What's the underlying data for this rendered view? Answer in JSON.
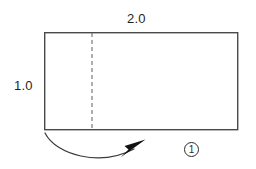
{
  "figure": {
    "type": "geometry-diagram",
    "canvas": {
      "width": 256,
      "height": 169,
      "background": "#ffffff"
    },
    "rectangle": {
      "name": "main-rectangle",
      "x": 44,
      "y": 32,
      "width": 194,
      "height": 98,
      "stroke": "#4a4a4a",
      "stroke_width": 1.4,
      "fill": "none"
    },
    "dashed_line": {
      "name": "fold-dashed-line",
      "x": 92,
      "y_top": 32,
      "y_bottom": 130,
      "stroke": "#6e6e6e",
      "stroke_width": 1.1,
      "dash_pattern": "4 3"
    },
    "arrow": {
      "name": "rotation-arrow",
      "path": "M45,133 C58,158 104,168 137,147",
      "stroke": "#3a3a3a",
      "stroke_width": 1.2,
      "head_points": "145,140 121,157 128,150 124,147",
      "head_fill": "#111111"
    },
    "labels": {
      "width": "2.0",
      "height": "1.0"
    },
    "markers": {
      "step_one": "1"
    }
  }
}
